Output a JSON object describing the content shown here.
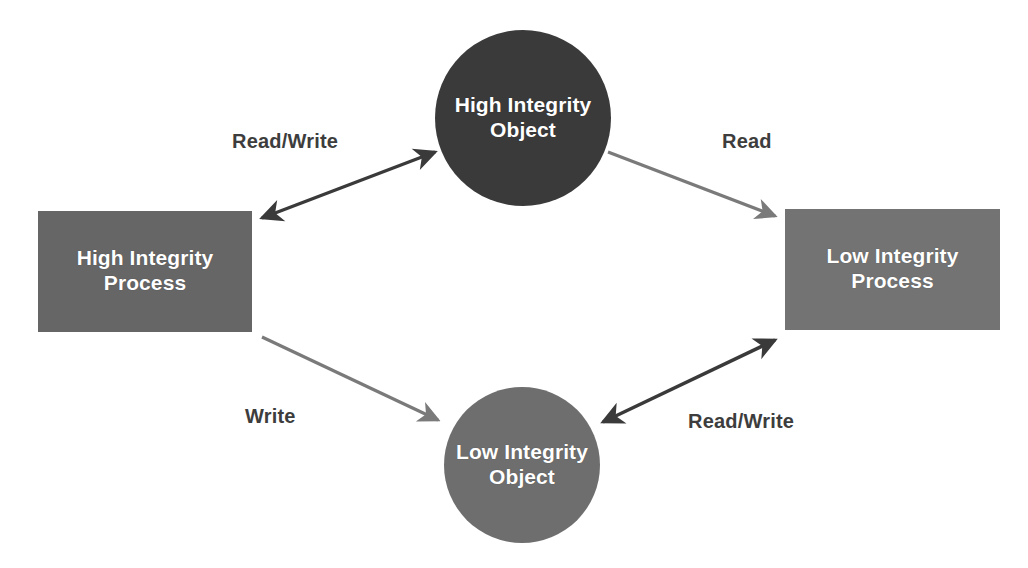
{
  "diagram": {
    "type": "integrity-access-control-diagram",
    "background_color": "#ffffff",
    "nodes": [
      {
        "id": "high-integrity-object",
        "shape": "circle",
        "line1": "High Integrity",
        "line2": "Object",
        "color": "#3a3a3a",
        "text_color": "#ffffff",
        "cx": 523,
        "cy": 118,
        "r": 88
      },
      {
        "id": "high-integrity-process",
        "shape": "rectangle",
        "line1": "High Integrity",
        "line2": "Process",
        "color": "#666666",
        "text_color": "#ffffff",
        "x": 38,
        "y": 211,
        "width": 214,
        "height": 121
      },
      {
        "id": "low-integrity-process",
        "shape": "rectangle",
        "line1": "Low Integrity",
        "line2": "Process",
        "color": "#737373",
        "text_color": "#ffffff",
        "x": 785,
        "y": 209,
        "width": 215,
        "height": 121
      },
      {
        "id": "low-integrity-object",
        "shape": "circle",
        "line1": "Low Integrity",
        "line2": "Object",
        "color": "#6e6e6e",
        "text_color": "#ffffff",
        "cx": 522,
        "cy": 465,
        "r": 78
      }
    ],
    "edges": [
      {
        "id": "hip-hio",
        "label": "Read/Write",
        "from": "high-integrity-process",
        "to": "high-integrity-object",
        "direction": "bidirectional",
        "color": "#3a3a3a",
        "label_x": 232,
        "label_y": 130
      },
      {
        "id": "hio-lip",
        "label": "Read",
        "from": "high-integrity-object",
        "to": "low-integrity-process",
        "direction": "unidirectional",
        "color": "#7a7a7a",
        "label_x": 722,
        "label_y": 130
      },
      {
        "id": "hip-lio",
        "label": "Write",
        "from": "high-integrity-process",
        "to": "low-integrity-object",
        "direction": "unidirectional",
        "color": "#7a7a7a",
        "label_x": 245,
        "label_y": 405
      },
      {
        "id": "lio-lip",
        "label": "Read/Write",
        "from": "low-integrity-object",
        "to": "low-integrity-process",
        "direction": "bidirectional",
        "color": "#3a3a3a",
        "label_x": 688,
        "label_y": 410
      }
    ]
  }
}
